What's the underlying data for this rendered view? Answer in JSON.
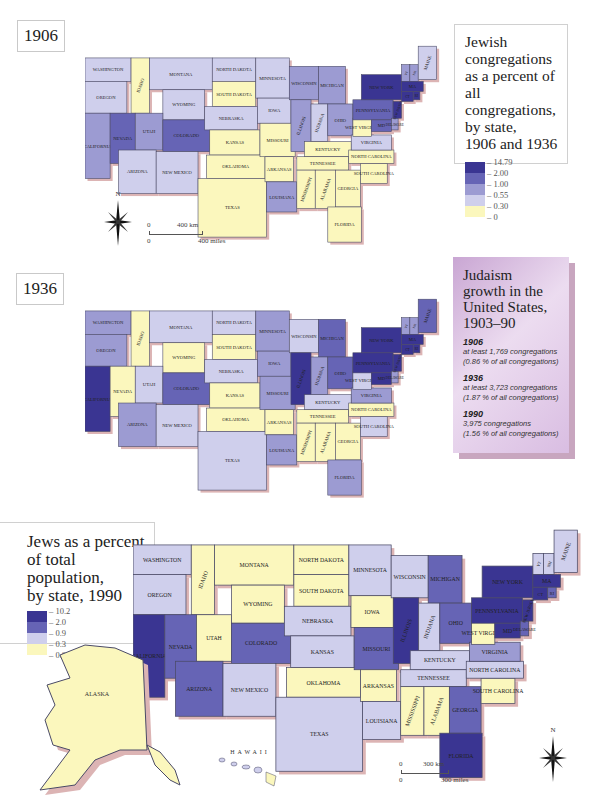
{
  "colors": {
    "c5": "#3a3592",
    "c4": "#6664b5",
    "c3": "#9c9bd2",
    "c2": "#cfcfec",
    "c1": "#fbf7bd",
    "outline": "#4a4a66",
    "shadow": "#dcb4b4"
  },
  "map1906": {
    "year_label": "1906",
    "legend": {
      "title_lines": [
        "Jewish",
        "congregations",
        "as a percent of all",
        "congregations,",
        "by state,",
        "1906 and 1936"
      ],
      "ticks": [
        "14.79",
        "2.00",
        "1.00",
        "0.55",
        "0.30",
        "0"
      ]
    },
    "scale": {
      "zero_top": "0",
      "km": "400 km",
      "zero_bottom": "0",
      "miles": "400 miles"
    },
    "compass_label": "N"
  },
  "map1936": {
    "year_label": "1936"
  },
  "info_panel": {
    "title_lines": [
      "Judaism",
      "growth in the",
      "United States,",
      "1903–90"
    ],
    "entries": [
      {
        "year": "1906",
        "line1": "at least 1,769 congregations",
        "line2": "(0.86 % of all congregations)"
      },
      {
        "year": "1936",
        "line1": "at least 3,723 congregations",
        "line2": "(1.87 % of all congregations)"
      },
      {
        "year": "1990",
        "line1": "3,975 congregations",
        "line2": "(1.56 % of all congregations)"
      }
    ]
  },
  "map1990": {
    "legend": {
      "title_lines": [
        "Jews as a percent",
        "of total population,",
        "by state, 1990"
      ],
      "ticks": [
        "10.2",
        "2.0",
        "0.9",
        "0.3",
        "0.0"
      ]
    },
    "scale": {
      "zero_top": "0",
      "km": "300 km",
      "zero_bottom": "0",
      "miles": "300 miles"
    },
    "compass_label": "N",
    "alaska_label": "ALASKA",
    "hawaii_label": "HAWAII"
  },
  "states": [
    {
      "name": "WASHINGTON",
      "x": 0,
      "y": 0,
      "w": 55,
      "h": 28,
      "c1906": "c2",
      "c1936": "c3",
      "c1990": "c2"
    },
    {
      "name": "OREGON",
      "x": 0,
      "y": 28,
      "w": 50,
      "h": 38,
      "c1906": "c2",
      "c1936": "c3",
      "c1990": "c2"
    },
    {
      "name": "CALIFORNIA",
      "x": 0,
      "y": 66,
      "w": 30,
      "h": 78,
      "c1906": "c3",
      "c1936": "c5",
      "c1990": "c5"
    },
    {
      "name": "IDAHO",
      "x": 55,
      "y": 0,
      "w": 22,
      "h": 66,
      "c1906": "c1",
      "c1936": "c1",
      "c1990": "c1"
    },
    {
      "name": "NEVADA",
      "x": 30,
      "y": 66,
      "w": 30,
      "h": 60,
      "c1906": "c4",
      "c1936": "c1",
      "c1990": "c4"
    },
    {
      "name": "MONTANA",
      "x": 77,
      "y": 0,
      "w": 75,
      "h": 38,
      "c1906": "c2",
      "c1936": "c2",
      "c1990": "c1"
    },
    {
      "name": "WYOMING",
      "x": 93,
      "y": 38,
      "w": 50,
      "h": 36,
      "c1906": "c2",
      "c1936": "c1",
      "c1990": "c1"
    },
    {
      "name": "UTAH",
      "x": 60,
      "y": 66,
      "w": 33,
      "h": 44,
      "c1906": "c3",
      "c1936": "c2",
      "c1990": "c1"
    },
    {
      "name": "COLORADO",
      "x": 93,
      "y": 74,
      "w": 56,
      "h": 38,
      "c1906": "c4",
      "c1936": "c4",
      "c1990": "c4"
    },
    {
      "name": "ARIZONA",
      "x": 40,
      "y": 110,
      "w": 45,
      "h": 52,
      "c1906": "c2",
      "c1936": "c3",
      "c1990": "c4"
    },
    {
      "name": "NEW MEXICO",
      "x": 85,
      "y": 112,
      "w": 50,
      "h": 50,
      "c1906": "c2",
      "c1936": "c2",
      "c1990": "c2"
    },
    {
      "name": "NORTH DAKOTA",
      "x": 152,
      "y": 0,
      "w": 52,
      "h": 28,
      "c1906": "c2",
      "c1936": "c2",
      "c1990": "c1"
    },
    {
      "name": "SOUTH DAKOTA",
      "x": 152,
      "y": 28,
      "w": 52,
      "h": 30,
      "c1906": "c1",
      "c1936": "c1",
      "c1990": "c1"
    },
    {
      "name": "NEBRASKA",
      "x": 143,
      "y": 58,
      "w": 63,
      "h": 28,
      "c1906": "c2",
      "c1936": "c2",
      "c1990": "c2"
    },
    {
      "name": "KANSAS",
      "x": 149,
      "y": 86,
      "w": 60,
      "h": 30,
      "c1906": "c1",
      "c1936": "c1",
      "c1990": "c2"
    },
    {
      "name": "OKLAHOMA",
      "x": 145,
      "y": 116,
      "w": 70,
      "h": 28,
      "c1906": "c1",
      "c1936": "c1",
      "c1990": "c1"
    },
    {
      "name": "TEXAS",
      "x": 135,
      "y": 144,
      "w": 82,
      "h": 70,
      "c1906": "c1",
      "c1936": "c2",
      "c1990": "c2"
    },
    {
      "name": "MINNESOTA",
      "x": 204,
      "y": 0,
      "w": 40,
      "h": 48,
      "c1906": "c2",
      "c1936": "c3",
      "c1990": "c2"
    },
    {
      "name": "IOWA",
      "x": 206,
      "y": 48,
      "w": 40,
      "h": 30,
      "c1906": "c2",
      "c1936": "c3",
      "c1990": "c1"
    },
    {
      "name": "MISSOURI",
      "x": 209,
      "y": 78,
      "w": 42,
      "h": 40,
      "c1906": "c1",
      "c1936": "c3",
      "c1990": "c4"
    },
    {
      "name": "ARKANSAS",
      "x": 215,
      "y": 118,
      "w": 34,
      "h": 30,
      "c1906": "c1",
      "c1936": "c1",
      "c1990": "c1"
    },
    {
      "name": "LOUISIANA",
      "x": 217,
      "y": 148,
      "w": 36,
      "h": 36,
      "c1906": "c3",
      "c1936": "c3",
      "c1990": "c2"
    },
    {
      "name": "WISCONSIN",
      "x": 244,
      "y": 10,
      "w": 35,
      "h": 40,
      "c1906": "c3",
      "c1936": "c2",
      "c1990": "c2"
    },
    {
      "name": "ILLINOIS",
      "x": 246,
      "y": 50,
      "w": 24,
      "h": 62,
      "c1906": "c3",
      "c1936": "c5",
      "c1990": "c5"
    },
    {
      "name": "MICHIGAN",
      "x": 279,
      "y": 10,
      "w": 32,
      "h": 45,
      "c1906": "c3",
      "c1936": "c4",
      "c1990": "c4"
    },
    {
      "name": "INDIANA",
      "x": 270,
      "y": 55,
      "w": 20,
      "h": 45,
      "c1906": "c2",
      "c1936": "c3",
      "c1990": "c2"
    },
    {
      "name": "OHIO",
      "x": 290,
      "y": 55,
      "w": 30,
      "h": 38,
      "c1906": "c3",
      "c1936": "c4",
      "c1990": "c4"
    },
    {
      "name": "KENTUCKY",
      "x": 262,
      "y": 100,
      "w": 56,
      "h": 18,
      "c1906": "c1",
      "c1936": "c2",
      "c1990": "c2"
    },
    {
      "name": "TENNESSEE",
      "x": 253,
      "y": 118,
      "w": 62,
      "h": 16,
      "c1906": "c1",
      "c1936": "c1",
      "c1990": "c2"
    },
    {
      "name": "MISSISSIPPI",
      "x": 253,
      "y": 134,
      "w": 22,
      "h": 46,
      "c1906": "c1",
      "c1936": "c1",
      "c1990": "c1"
    },
    {
      "name": "ALABAMA",
      "x": 275,
      "y": 134,
      "w": 24,
      "h": 46,
      "c1906": "c1",
      "c1936": "c1",
      "c1990": "c1"
    },
    {
      "name": "GEORGIA",
      "x": 299,
      "y": 134,
      "w": 30,
      "h": 44,
      "c1906": "c1",
      "c1936": "c1",
      "c1990": "c4"
    },
    {
      "name": "FLORIDA",
      "x": 290,
      "y": 178,
      "w": 40,
      "h": 42,
      "c1906": "c1",
      "c1936": "c3",
      "c1990": "c5"
    },
    {
      "name": "SOUTH CAROLINA",
      "x": 329,
      "y": 126,
      "w": 32,
      "h": 24,
      "c1906": "c1",
      "c1936": "c2",
      "c1990": "c1"
    },
    {
      "name": "NORTH CAROLINA",
      "x": 315,
      "y": 110,
      "w": 54,
      "h": 16,
      "c1906": "c1",
      "c1936": "c1",
      "c1990": "c2"
    },
    {
      "name": "VIRGINIA",
      "x": 318,
      "y": 92,
      "w": 48,
      "h": 18,
      "c1906": "c2",
      "c1936": "c3",
      "c1990": "c3"
    },
    {
      "name": "WEST VIRGINIA",
      "x": 320,
      "y": 72,
      "w": 22,
      "h": 22,
      "c1906": "c1",
      "c1936": "c2",
      "c1990": "c1"
    },
    {
      "name": "PENNSYLVANIA",
      "x": 320,
      "y": 50,
      "w": 48,
      "h": 24,
      "c1906": "c4",
      "c1936": "c5",
      "c1990": "c5"
    },
    {
      "name": "NEW YORK",
      "x": 330,
      "y": 20,
      "w": 48,
      "h": 30,
      "c1906": "c5",
      "c1936": "c5",
      "c1990": "c5"
    },
    {
      "name": "MD",
      "x": 342,
      "y": 74,
      "w": 24,
      "h": 14,
      "c1906": "c4",
      "c1936": "c5",
      "c1990": "c5"
    },
    {
      "name": "DELAWARE",
      "x": 366,
      "y": 72,
      "w": 8,
      "h": 14,
      "c1906": "c3",
      "c1936": "c3",
      "c1990": "c4"
    },
    {
      "name": "NEW JERSEY",
      "x": 368,
      "y": 52,
      "w": 10,
      "h": 20,
      "c1906": "c5",
      "c1936": "c5",
      "c1990": "c5"
    },
    {
      "name": "VT",
      "x": 378,
      "y": 8,
      "w": 10,
      "h": 20,
      "c1906": "c3",
      "c1936": "c3",
      "c1990": "c2"
    },
    {
      "name": "NH",
      "x": 388,
      "y": 8,
      "w": 10,
      "h": 20,
      "c1906": "c3",
      "c1936": "c3",
      "c1990": "c2"
    },
    {
      "name": "MAINE",
      "x": 398,
      "y": -14,
      "w": 22,
      "h": 40,
      "c1906": "c2",
      "c1936": "c4",
      "c1990": "c2"
    },
    {
      "name": "MA",
      "x": 378,
      "y": 28,
      "w": 26,
      "h": 12,
      "c1906": "c5",
      "c1936": "c5",
      "c1990": "c5"
    },
    {
      "name": "CT",
      "x": 378,
      "y": 40,
      "w": 14,
      "h": 12,
      "c1906": "c5",
      "c1936": "c5",
      "c1990": "c5"
    },
    {
      "name": "RI",
      "x": 392,
      "y": 40,
      "w": 8,
      "h": 10,
      "c1906": "c5",
      "c1936": "c5",
      "c1990": "c4"
    }
  ]
}
